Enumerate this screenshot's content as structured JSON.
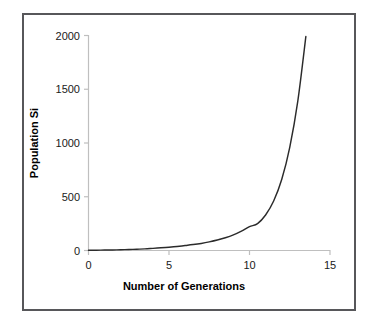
{
  "chart_data": {
    "type": "line",
    "title": "",
    "xlabel": "Number of Generations",
    "ylabel": "Population Si",
    "xlim": [
      0,
      15
    ],
    "ylim": [
      0,
      2000
    ],
    "xticks": [
      0,
      5,
      10,
      15
    ],
    "yticks": [
      0,
      500,
      1000,
      1500,
      2000
    ],
    "xtick_labels": [
      "0",
      "5",
      "10",
      "15"
    ],
    "ytick_labels": [
      "0",
      "500",
      "1000",
      "1500",
      "2000"
    ],
    "grid": false,
    "legend": "none",
    "series": [
      {
        "name": "Population size",
        "color": "#2b2b2b",
        "x": [
          0,
          0.5,
          1,
          1.5,
          2,
          2.5,
          3,
          3.5,
          4,
          4.5,
          5,
          5.5,
          6,
          6.5,
          7,
          7.5,
          8,
          8.5,
          9,
          9.5,
          10,
          10.5,
          11,
          11.5,
          12,
          12.5,
          13,
          13.5
        ],
        "values": [
          2,
          3,
          4,
          5,
          7,
          9,
          12,
          15,
          20,
          25,
          31,
          38,
          46,
          55,
          66,
          80,
          97,
          118,
          145,
          180,
          222,
          250,
          330,
          460,
          660,
          960,
          1390,
          1990
        ]
      }
    ],
    "annotations": []
  },
  "axes": {
    "x_axis_color": "#bfbfbf",
    "y_axis_color": "#bfbfbf",
    "tick_color": "#bfbfbf",
    "label_color": "#1a1a1a"
  },
  "frame": {
    "border_color": "#57575a",
    "background": "#ffffff"
  }
}
